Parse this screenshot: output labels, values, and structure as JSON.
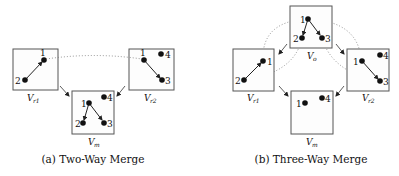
{
  "panels": [
    {
      "caption": "(a) Two-Way Merge",
      "views": {
        "vr1": {
          "label": "V",
          "sub": "r1",
          "nodes": [
            "1",
            "2"
          ]
        },
        "vr2": {
          "label": "V",
          "sub": "r2",
          "nodes": [
            "1",
            "3",
            "4"
          ]
        },
        "vm": {
          "label": "V",
          "sub": "m",
          "nodes": [
            "1",
            "2",
            "3",
            "4"
          ]
        }
      }
    },
    {
      "caption": "(b) Three-Way Merge",
      "views": {
        "vo": {
          "label": "V",
          "sub": "o",
          "nodes": [
            "1",
            "2",
            "3"
          ]
        },
        "vr1": {
          "label": "V",
          "sub": "r1",
          "nodes": [
            "1",
            "2"
          ]
        },
        "vr2": {
          "label": "V",
          "sub": "r2",
          "nodes": [
            "1",
            "3",
            "4"
          ]
        },
        "vm": {
          "label": "V",
          "sub": "m",
          "nodes": [
            "1",
            "4"
          ]
        }
      }
    }
  ]
}
